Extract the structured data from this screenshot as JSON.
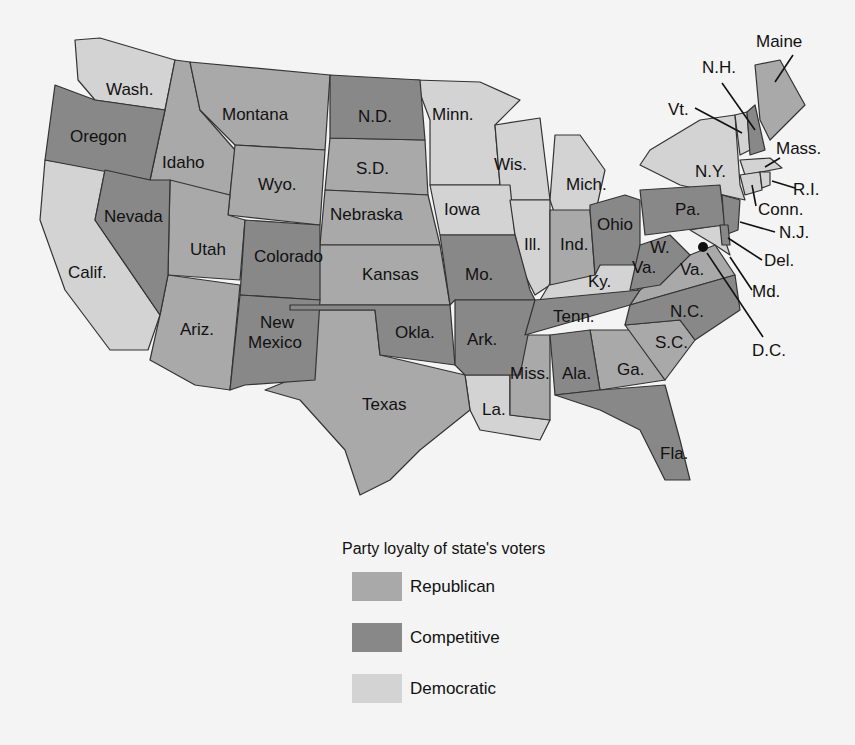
{
  "legend": {
    "title": "Party  loyalty of state's voters",
    "items": [
      {
        "label": "Republican",
        "color": "#a9a9a9"
      },
      {
        "label": "Competitive",
        "color": "#888888"
      },
      {
        "label": "Democratic",
        "color": "#d3d3d3"
      }
    ]
  },
  "states": {
    "wash": "Wash.",
    "oregon": "Oregon",
    "calif": "Calif.",
    "idaho": "Idaho",
    "nevada": "Nevada",
    "montana": "Montana",
    "wyo": "Wyo.",
    "utah": "Utah",
    "ariz": "Ariz.",
    "colorado": "Colorado",
    "newmexico1": "New",
    "newmexico2": "Mexico",
    "nd": "N.D.",
    "sd": "S.D.",
    "nebraska": "Nebraska",
    "kansas": "Kansas",
    "okla": "Okla.",
    "texas": "Texas",
    "minn": "Minn.",
    "iowa": "Iowa",
    "mo": "Mo.",
    "ark": "Ark.",
    "la": "La.",
    "wis": "Wis.",
    "ill": "Ill.",
    "mich": "Mich.",
    "ind": "Ind.",
    "ohio": "Ohio",
    "ky": "Ky.",
    "tenn": "Tenn.",
    "miss": "Miss.",
    "ala": "Ala.",
    "ga": "Ga.",
    "fla": "Fla.",
    "sc": "S.C.",
    "nc": "N.C.",
    "va": "Va.",
    "wva1": "W.",
    "wva2": "Va.",
    "pa": "Pa.",
    "ny": "N.Y.",
    "vt": "Vt.",
    "nh": "N.H.",
    "maine": "Maine",
    "mass": "Mass.",
    "ri": "R.I.",
    "conn": "Conn.",
    "nj": "N.J.",
    "del": "Del.",
    "md": "Md.",
    "dc": "D.C."
  }
}
